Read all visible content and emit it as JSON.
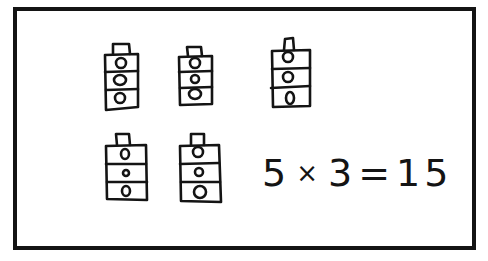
{
  "diagram": {
    "groups": [
      {
        "id": 1,
        "blocks": 3
      },
      {
        "id": 2,
        "blocks": 3
      },
      {
        "id": 3,
        "blocks": 3
      },
      {
        "id": 4,
        "blocks": 3
      },
      {
        "id": 5,
        "blocks": 3
      }
    ],
    "equation": {
      "factor_a": "5",
      "times": "×",
      "factor_b": "3",
      "equals": "=",
      "result": "15"
    },
    "colors": {
      "ink": "#141414",
      "paper": "#ffffff"
    }
  }
}
